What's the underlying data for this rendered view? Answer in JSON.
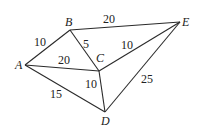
{
  "diagram": {
    "type": "weighted-undirected-graph",
    "nodes": [
      {
        "id": "A",
        "label": "A",
        "x": 25,
        "y": 65,
        "lx": 15,
        "ly": 69
      },
      {
        "id": "B",
        "label": "B",
        "x": 70,
        "y": 30,
        "lx": 65,
        "ly": 26
      },
      {
        "id": "C",
        "label": "C",
        "x": 99,
        "y": 71,
        "lx": 96,
        "ly": 62
      },
      {
        "id": "D",
        "label": "D",
        "x": 105,
        "y": 112,
        "lx": 101,
        "ly": 125
      },
      {
        "id": "E",
        "label": "E",
        "x": 180,
        "y": 22,
        "lx": 182,
        "ly": 26
      }
    ],
    "edges": [
      {
        "from": "A",
        "to": "B",
        "weight": "10",
        "lx": 34,
        "ly": 46
      },
      {
        "from": "A",
        "to": "C",
        "weight": "20",
        "lx": 58,
        "ly": 64
      },
      {
        "from": "A",
        "to": "D",
        "weight": "15",
        "lx": 50,
        "ly": 98
      },
      {
        "from": "B",
        "to": "C",
        "weight": "5",
        "lx": 83,
        "ly": 48
      },
      {
        "from": "B",
        "to": "E",
        "weight": "20",
        "lx": 103,
        "ly": 23
      },
      {
        "from": "C",
        "to": "E",
        "weight": "10",
        "lx": 121,
        "ly": 49
      },
      {
        "from": "C",
        "to": "D",
        "weight": "10",
        "lx": 85,
        "ly": 88
      },
      {
        "from": "D",
        "to": "E",
        "weight": "25",
        "lx": 141,
        "ly": 83
      }
    ]
  }
}
